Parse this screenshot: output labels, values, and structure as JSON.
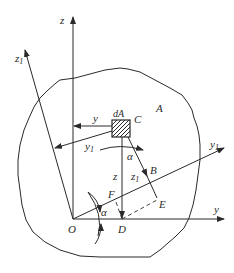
{
  "figure": {
    "region_label": "A",
    "element_label": "dA",
    "axes": {
      "z": "z",
      "z1": "z",
      "z1_sub": "1",
      "y": "y",
      "y1": "y",
      "y1_sub": "1"
    },
    "points": {
      "O": "O",
      "C": "C",
      "B": "B",
      "D": "D",
      "E": "E",
      "F": "F"
    },
    "inner_labels": {
      "y_arrow": "y",
      "y1_arrow": "y",
      "y1_arrow_sub": "1",
      "z_arrow": "z",
      "z1_arrow": "z",
      "z1_arrow_sub": "1"
    },
    "angle_label": "α",
    "colors": {
      "stroke": "#2a2a2a",
      "background": "#ffffff"
    }
  }
}
